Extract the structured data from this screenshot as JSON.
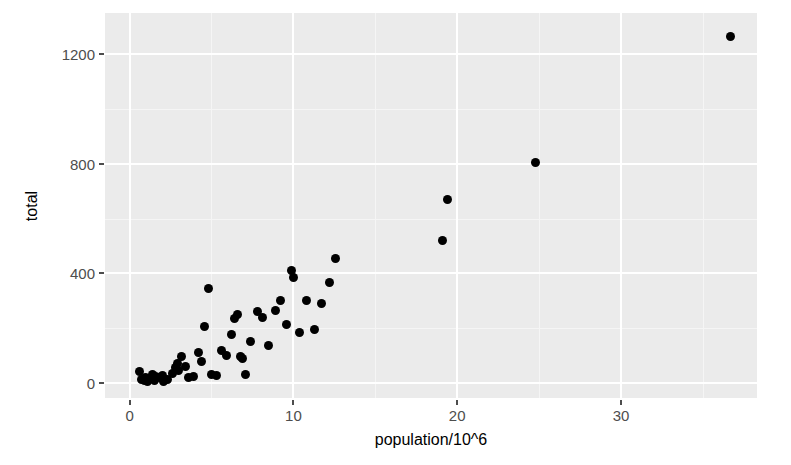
{
  "chart_data": {
    "type": "scatter",
    "title": "",
    "xlabel": "population/10^6",
    "ylabel": "total",
    "xlim": [
      -1.5,
      38.3
    ],
    "ylim": [
      -55,
      1350
    ],
    "xticks": [
      0,
      10,
      20,
      30
    ],
    "yticks": [
      0,
      400,
      800,
      1200
    ],
    "xtick_labels": [
      "0",
      "10",
      "20",
      "30"
    ],
    "ytick_labels": [
      "0",
      "400",
      "800",
      "1200"
    ],
    "x_minor_ticks": [
      5,
      15,
      25,
      35
    ],
    "y_minor_ticks": [
      200,
      600,
      1000,
      1200
    ],
    "grid": true,
    "legend": "none",
    "point_color": "#000000",
    "point_size_px": 9,
    "panel_background": "#ebebeb",
    "gridline_color": "#ffffff",
    "series": [
      {
        "name": "states",
        "points": [
          [
            0.6,
            40
          ],
          [
            0.7,
            12
          ],
          [
            0.9,
            8
          ],
          [
            1.0,
            20
          ],
          [
            1.1,
            5
          ],
          [
            1.3,
            15
          ],
          [
            1.4,
            30
          ],
          [
            1.5,
            10
          ],
          [
            1.6,
            22
          ],
          [
            1.8,
            18
          ],
          [
            2.0,
            26
          ],
          [
            2.1,
            6
          ],
          [
            2.3,
            12
          ],
          [
            2.6,
            35
          ],
          [
            2.8,
            55
          ],
          [
            2.9,
            70
          ],
          [
            3.0,
            45
          ],
          [
            3.2,
            95
          ],
          [
            3.4,
            60
          ],
          [
            3.6,
            20
          ],
          [
            3.9,
            25
          ],
          [
            4.2,
            110
          ],
          [
            4.4,
            80
          ],
          [
            4.6,
            205
          ],
          [
            4.8,
            345
          ],
          [
            5.0,
            30
          ],
          [
            5.3,
            28
          ],
          [
            5.6,
            120
          ],
          [
            5.9,
            100
          ],
          [
            6.2,
            175
          ],
          [
            6.4,
            235
          ],
          [
            6.6,
            250
          ],
          [
            6.8,
            95
          ],
          [
            6.9,
            88
          ],
          [
            7.1,
            30
          ],
          [
            7.4,
            150
          ],
          [
            7.8,
            260
          ],
          [
            8.1,
            240
          ],
          [
            8.5,
            135
          ],
          [
            8.9,
            265
          ],
          [
            9.2,
            300
          ],
          [
            9.6,
            215
          ],
          [
            9.9,
            410
          ],
          [
            10.0,
            385
          ],
          [
            10.4,
            185
          ],
          [
            10.8,
            300
          ],
          [
            11.3,
            195
          ],
          [
            11.7,
            290
          ],
          [
            12.2,
            365
          ],
          [
            12.6,
            455
          ],
          [
            19.1,
            520
          ],
          [
            19.4,
            670
          ],
          [
            24.8,
            805
          ],
          [
            36.7,
            1265
          ]
        ]
      }
    ]
  }
}
